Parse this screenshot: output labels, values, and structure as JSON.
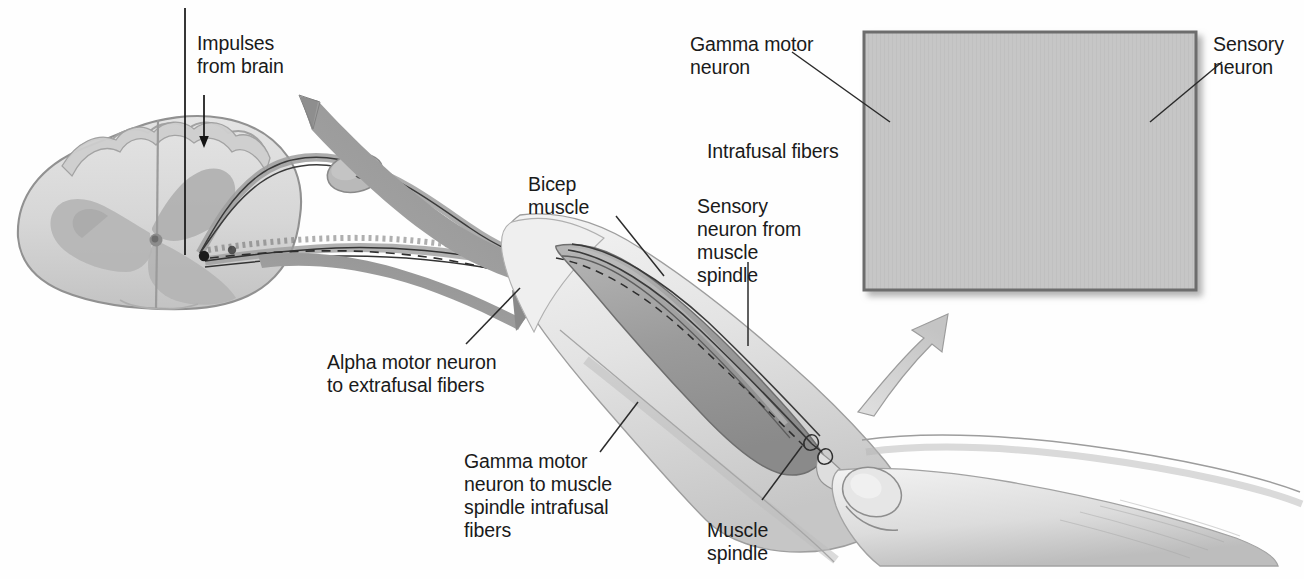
{
  "figure": {
    "background": "#ffffff",
    "ink": "#1a1a1a"
  },
  "labels": {
    "impulses_from_brain": "Impulses\nfrom brain",
    "bicep_muscle": "Bicep\nmuscle",
    "alpha_motor_neuron": "Alpha motor neuron\nto extrafusal fibers",
    "gamma_motor_neuron_spindle": "Gamma motor\nneuron to muscle\nspindle intrafusal\nfibers",
    "sensory_neuron_from_spindle": "Sensory\nneuron from\nmuscle\nspindle",
    "muscle_spindle": "Muscle\nspindle",
    "gamma_motor_neuron_inset": "Gamma motor\nneuron",
    "intrafusal_fibers_inset": "Intrafusal fibers",
    "sensory_neuron_inset": "Sensory\nneuron"
  },
  "colors": {
    "cord_fill": "#d8d8d8",
    "cord_gray_matter": "#b4b4b4",
    "cord_outline": "#8c8c8c",
    "arrow_gray": "#9a9a9a",
    "arrow_light": "#d2d2d2",
    "arm_light": "#ebebeb",
    "arm_mid": "#c9c9c9",
    "muscle_dark": "#9f9f9f",
    "inset_bg": "#c4c4c4",
    "inset_border": "#6f6f6f",
    "fiber_dark": "#2a2a2a",
    "leader_line": "#2b2b2b"
  },
  "inset": {
    "name": "muscle-spindle-detail",
    "x": 864,
    "y": 32,
    "width": 332,
    "height": 258,
    "stretch_arrow_left": "←",
    "stretch_arrow_right": "→"
  }
}
